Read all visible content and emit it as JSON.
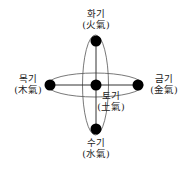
{
  "diagram": {
    "nodes": [
      {
        "id": "fire",
        "korean": "화기",
        "hanja": "(火氣)",
        "position": "top"
      },
      {
        "id": "wood",
        "korean": "목기",
        "hanja": "(木氣)",
        "position": "left"
      },
      {
        "id": "earth",
        "korean": "토기",
        "hanja": "(土氣)",
        "position": "center"
      },
      {
        "id": "metal",
        "korean": "금기",
        "hanja": "(金氣)",
        "position": "right"
      },
      {
        "id": "water",
        "korean": "수기",
        "hanja": "(水氣)",
        "position": "bottom"
      }
    ],
    "colors": {
      "stroke": "#333333",
      "dot": "#000000",
      "background": "#ffffff"
    }
  }
}
